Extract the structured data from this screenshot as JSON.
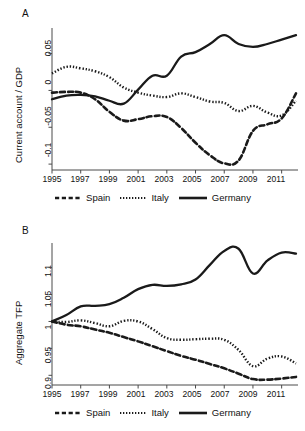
{
  "figure": {
    "panels": [
      {
        "id": "A",
        "label": "A",
        "ylabel": "Current account / GDP",
        "yticks": [
          "0.05",
          "0",
          "-0.05",
          "-0.1"
        ],
        "xticks": [
          "1995",
          "1997",
          "1999",
          "2001",
          "2003",
          "2005",
          "2007",
          "2009",
          "2011"
        ]
      },
      {
        "id": "B",
        "label": "B",
        "ylabel": "Aggregate TFP",
        "yticks": [
          "1.1",
          "1.05",
          "1",
          "0.95",
          "0.9"
        ],
        "xticks": [
          "1995",
          "1997",
          "1999",
          "2001",
          "2003",
          "2005",
          "2007",
          "2009",
          "2011"
        ]
      }
    ],
    "legend": {
      "items": [
        {
          "label": "Spain",
          "style": "dashed",
          "swatch": "dashed-line-swatch"
        },
        {
          "label": "Italy",
          "style": "dotted",
          "swatch": "dotted-line-swatch"
        },
        {
          "label": "Germany",
          "style": "solid",
          "swatch": "solid-line-swatch"
        }
      ]
    },
    "colors": {
      "line": "#1a1a1a",
      "axis": "#4a4a4a",
      "background": "#ffffff"
    }
  },
  "chart_data": [
    {
      "type": "line",
      "panel": "A",
      "title": "",
      "xlabel": "",
      "ylabel": "Current account / GDP",
      "xlim": [
        1995,
        2012
      ],
      "ylim": [
        -0.108,
        0.082
      ],
      "grid": false,
      "legend_position": "bottom",
      "x": [
        1995,
        1996,
        1997,
        1998,
        1999,
        2000,
        2001,
        2002,
        2003,
        2004,
        2005,
        2006,
        2007,
        2008,
        2009,
        2010,
        2011,
        2012
      ],
      "series": [
        {
          "name": "Spain",
          "style": "dashed",
          "values": [
            -0.003,
            -0.002,
            -0.003,
            -0.012,
            -0.029,
            -0.041,
            -0.039,
            -0.035,
            -0.036,
            -0.051,
            -0.071,
            -0.088,
            -0.099,
            -0.095,
            -0.055,
            -0.046,
            -0.038,
            -0.004
          ]
        },
        {
          "name": "Italy",
          "style": "dotted",
          "values": [
            0.023,
            0.032,
            0.03,
            0.026,
            0.018,
            0.004,
            -0.003,
            -0.007,
            -0.009,
            -0.004,
            -0.009,
            -0.015,
            -0.017,
            -0.028,
            -0.021,
            -0.03,
            -0.034,
            -0.014
          ]
        },
        {
          "name": "Germany",
          "style": "solid",
          "values": [
            -0.012,
            -0.007,
            -0.006,
            -0.008,
            -0.014,
            -0.018,
            0.001,
            0.02,
            0.02,
            0.046,
            0.052,
            0.063,
            0.075,
            0.063,
            0.059,
            0.063,
            0.069,
            0.075
          ]
        }
      ]
    },
    {
      "type": "line",
      "panel": "B",
      "title": "",
      "xlabel": "",
      "ylabel": "Aggregate TFP",
      "xlim": [
        1995,
        2012
      ],
      "ylim": [
        0.882,
        1.142
      ],
      "grid": false,
      "legend_position": "bottom",
      "x": [
        1995,
        1996,
        1997,
        1998,
        1999,
        2000,
        2001,
        2002,
        2003,
        2004,
        2005,
        2006,
        2007,
        2008,
        2009,
        2010,
        2011,
        2012
      ],
      "series": [
        {
          "name": "Spain",
          "style": "dashed",
          "values": [
            1.0,
            0.994,
            0.991,
            0.985,
            0.979,
            0.971,
            0.963,
            0.954,
            0.945,
            0.936,
            0.929,
            0.921,
            0.913,
            0.903,
            0.893,
            0.892,
            0.894,
            0.897
          ]
        },
        {
          "name": "Italy",
          "style": "dotted",
          "values": [
            1.0,
            0.999,
            1.002,
            0.997,
            0.991,
            1.001,
            1.0,
            0.986,
            0.969,
            0.966,
            0.967,
            0.968,
            0.966,
            0.947,
            0.917,
            0.931,
            0.935,
            0.922
          ]
        },
        {
          "name": "Germany",
          "style": "solid",
          "values": [
            1.0,
            1.012,
            1.028,
            1.029,
            1.032,
            1.044,
            1.06,
            1.068,
            1.066,
            1.069,
            1.078,
            1.105,
            1.131,
            1.135,
            1.089,
            1.113,
            1.128,
            1.126
          ]
        }
      ]
    }
  ]
}
